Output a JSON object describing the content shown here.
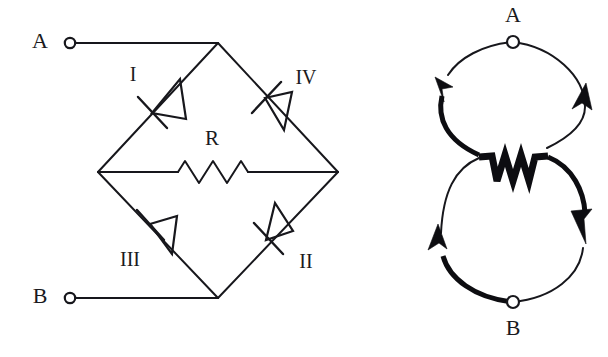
{
  "figure": {
    "background_color": "#ffffff",
    "line_color": "#17171c"
  },
  "left_diagram": {
    "name": "bridge-rectifier-circuit",
    "terminals": [
      {
        "id": "A",
        "label": "A",
        "x": 60,
        "y": 43
      },
      {
        "id": "B",
        "label": "B",
        "x": 60,
        "y": 298
      }
    ],
    "nodes": {
      "top": {
        "x": 218,
        "y": 43
      },
      "left": {
        "x": 98,
        "y": 172
      },
      "right": {
        "x": 338,
        "y": 172
      },
      "bottom": {
        "x": 218,
        "y": 298
      }
    },
    "diodes": [
      {
        "id": "I",
        "label": "I",
        "label_x": 133,
        "label_y": 76,
        "branch": "top-to-left",
        "center_x": 158,
        "center_y": 108,
        "direction": "points-down-left",
        "cathode_end": "lower-left"
      },
      {
        "id": "IV",
        "label": "IV",
        "label_x": 304,
        "label_y": 79,
        "branch": "top-to-right",
        "center_x": 270,
        "center_y": 103,
        "direction": "points-up-left",
        "cathode_end": "upper-left"
      },
      {
        "id": "III",
        "label": "III",
        "label_x": 130,
        "label_y": 261,
        "branch": "left-to-bottom",
        "center_x": 155,
        "center_y": 227,
        "direction": "points-up-left",
        "cathode_end": "upper-left"
      },
      {
        "id": "II",
        "label": "II",
        "label_x": 305,
        "label_y": 263,
        "branch": "bottom-to-right",
        "center_x": 273,
        "center_y": 234,
        "direction": "points-down-left",
        "cathode_end": "lower-left"
      }
    ],
    "resistor": {
      "id": "R",
      "label": "R",
      "label_x": 212,
      "label_y": 140,
      "branch": "left-to-right",
      "start_x": 178,
      "end_x": 248,
      "y": 172,
      "peaks": 5
    }
  },
  "right_diagram": {
    "name": "current-flow-loops",
    "terminals": [
      {
        "id": "A",
        "label": "A",
        "label_x": 513,
        "label_y": 18,
        "dot_x": 513,
        "dot_y": 42
      },
      {
        "id": "B",
        "label": "B",
        "label_x": 513,
        "label_y": 338,
        "dot_x": 513,
        "dot_y": 302
      }
    ],
    "loops": [
      {
        "id": "top-loop",
        "center_x": 513,
        "center_y": 107,
        "radius_x": 72,
        "radius_y": 65,
        "direction": "counterclockwise",
        "thick_side": "left",
        "arrows": [
          {
            "id": "top-left-arrow",
            "x": 443,
            "y": 95,
            "points": "down"
          },
          {
            "id": "top-right-arrow",
            "x": 583,
            "y": 100,
            "points": "up"
          }
        ]
      },
      {
        "id": "bottom-loop",
        "center_x": 513,
        "center_y": 237,
        "radius_x": 72,
        "radius_y": 65,
        "direction": "clockwise",
        "thick_side": "right",
        "arrows": [
          {
            "id": "bottom-right-arrow",
            "x": 583,
            "y": 245,
            "points": "down"
          },
          {
            "id": "bottom-left-arrow",
            "x": 443,
            "y": 250,
            "points": "up"
          }
        ]
      }
    ],
    "resistor": {
      "id": "R-center",
      "center_x": 513,
      "center_y": 172,
      "peaks": 4,
      "style": "thick-zigzag"
    }
  }
}
